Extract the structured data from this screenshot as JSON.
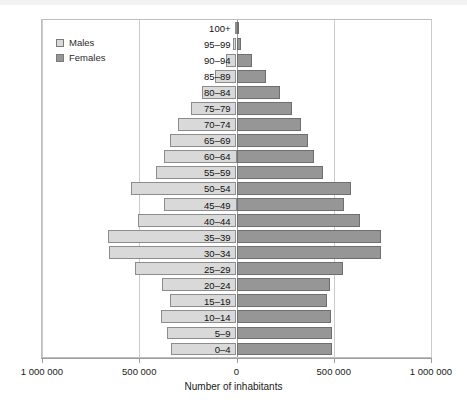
{
  "chart_data": {
    "type": "bar",
    "subtype": "population-pyramid",
    "title": "",
    "xlabel": "Number of inhabitants",
    "ylabel": "",
    "orientation": "horizontal",
    "grid": true,
    "legend_position": "top-left",
    "xlim": [
      -1000000,
      1000000
    ],
    "xticks": [
      -1000000,
      -500000,
      0,
      500000,
      1000000
    ],
    "xtick_labels": [
      "1 000 000",
      "500 000",
      "0",
      "500 000",
      "1 000 000"
    ],
    "categories": [
      "100+",
      "95–99",
      "90–94",
      "85–89",
      "80–84",
      "75–79",
      "70–74",
      "65–69",
      "60–64",
      "55–59",
      "50–54",
      "45–49",
      "40–44",
      "35–39",
      "30–34",
      "25–29",
      "20–24",
      "15–19",
      "10–14",
      "5–9",
      "0–4"
    ],
    "series": [
      {
        "name": "Males",
        "color": "#d9d9d9",
        "side": "left",
        "values": [
          3000,
          18000,
          55000,
          110000,
          175000,
          235000,
          300000,
          340000,
          375000,
          415000,
          540000,
          375000,
          505000,
          660000,
          655000,
          520000,
          385000,
          340000,
          390000,
          355000,
          335000
        ]
      },
      {
        "name": "Females",
        "color": "#969696",
        "side": "right",
        "values": [
          5000,
          25000,
          80000,
          150000,
          225000,
          285000,
          330000,
          370000,
          400000,
          445000,
          590000,
          555000,
          635000,
          745000,
          745000,
          545000,
          480000,
          465000,
          485000,
          490000,
          490000
        ]
      }
    ]
  },
  "legend": {
    "items": [
      {
        "label": "Males",
        "swatch": "males"
      },
      {
        "label": "Females",
        "swatch": "females"
      }
    ]
  },
  "axis": {
    "title": "Number of inhabitants"
  },
  "colors": {
    "male": "#d9d9d9",
    "female": "#969696",
    "grid": "#cccccc",
    "axis": "#9e9e9e",
    "border": "#bdbdbd"
  }
}
